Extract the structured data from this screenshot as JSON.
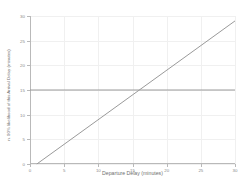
{
  "chart_data": {
    "type": "line",
    "title": "",
    "subtitle": "",
    "xlabel": "Departure Delay (minutes)",
    "ylabel": "n. 90% likelihood of this Arrival Delay (minutes)",
    "xlim": [
      0,
      30
    ],
    "ylim": [
      0,
      30
    ],
    "xticks": [
      0,
      5,
      10,
      15,
      20,
      25,
      30
    ],
    "yticks": [
      0,
      5,
      10,
      15,
      20,
      25,
      30
    ],
    "xticklabels": [
      "0",
      "5",
      "10",
      "15",
      "20",
      "25",
      "30"
    ],
    "yticklabels": [
      "0",
      "5",
      "10",
      "15",
      "20",
      "25",
      "30"
    ],
    "grid": true,
    "grid_color": "#f0f0f0",
    "legend": false,
    "legend_position": "none",
    "background_color": "#ffffff",
    "axis_color": "#b9b9b9",
    "tick_label_color": "#8a8a8a",
    "axis_label_color": "#6f6f6f",
    "series": [
      {
        "name": "threshold",
        "color": "#9a9a9a",
        "linewidth": 1,
        "x": [
          0,
          30
        ],
        "values": [
          15,
          15
        ]
      },
      {
        "name": "arrival-delay",
        "color": "#9a9a9a",
        "linewidth": 1,
        "x": [
          1,
          30
        ],
        "values": [
          0,
          29
        ]
      }
    ],
    "annotations": [],
    "intersection": {
      "x": 16,
      "y": 15
    }
  }
}
